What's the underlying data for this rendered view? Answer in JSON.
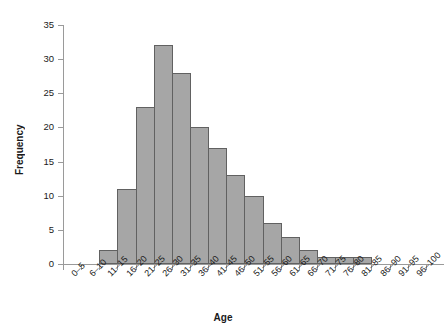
{
  "chart_data": {
    "type": "bar",
    "title": "",
    "subtitle": "",
    "xlabel": "Age",
    "ylabel": "Frequency",
    "categories": [
      "0–5",
      "6–10",
      "11–15",
      "16–20",
      "21–25",
      "26–30",
      "31–35",
      "36–40",
      "41–45",
      "46–50",
      "51–55",
      "56–60",
      "61–65",
      "66–70",
      "71–75",
      "76–80",
      "81–85",
      "86–90",
      "91–95",
      "96–100"
    ],
    "values": [
      0,
      0,
      2,
      11,
      23,
      32,
      28,
      20,
      17,
      13,
      10,
      6,
      4,
      2,
      1,
      1,
      1,
      0,
      0,
      0
    ],
    "ylim": [
      0,
      35
    ],
    "ytick_labels": [
      "35",
      "30",
      "25",
      "20",
      "15",
      "10",
      "5",
      "0"
    ],
    "ytick_values": [
      35,
      30,
      25,
      20,
      15,
      10,
      5,
      0
    ],
    "ystep": 5,
    "grid": false,
    "legend": null,
    "legend_position": "none",
    "annotations": [],
    "colors": {
      "bar_fill": "#a6a6a6",
      "bar_border": "#616161",
      "axis": "#9a9a9a",
      "text": "#1a1a1a",
      "background": "#ffffff"
    }
  }
}
